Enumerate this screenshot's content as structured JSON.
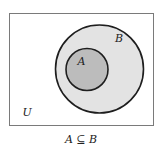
{
  "diagram": {
    "type": "venn",
    "universe": {
      "label": "U",
      "border_color": "#7a7a7a",
      "fill": "#ffffff"
    },
    "sets": [
      {
        "name": "B",
        "label": "B",
        "fill": "#e3e3e3",
        "stroke": "#1e1e1e"
      },
      {
        "name": "A",
        "label": "A",
        "fill": "#bcbcbc",
        "stroke": "#1e1e1e"
      }
    ],
    "relation": "A is a subset of B",
    "caption": "A ⊆ B"
  }
}
